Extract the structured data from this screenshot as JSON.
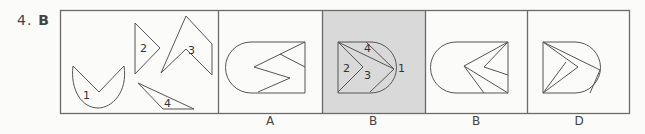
{
  "question": {
    "number": "4.",
    "answer": "B"
  },
  "colors": {
    "stroke": "#555555",
    "border": "#6b6b6b",
    "highlight": "#d9d9d9",
    "background": "#fbfbfa"
  },
  "pieces_panel": {
    "labels": [
      "1",
      "2",
      "3",
      "4"
    ]
  },
  "options": [
    {
      "label": "A",
      "highlighted": false
    },
    {
      "label": "B",
      "highlighted": true,
      "piece_labels": [
        "2",
        "3",
        "4",
        "1"
      ]
    },
    {
      "label": "B",
      "highlighted": false
    },
    {
      "label": "D",
      "highlighted": false
    }
  ]
}
